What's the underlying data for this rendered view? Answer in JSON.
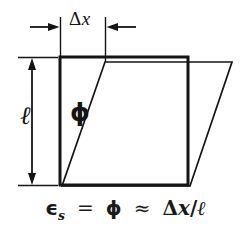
{
  "figure": {
    "background_color": "#ffffff",
    "ink_color": "#141414"
  },
  "labels": {
    "delta_x": "Δ",
    "delta_x_var": "x",
    "ell": "ℓ",
    "phi": "ϕ"
  },
  "equation": {
    "epsilon": "ϵ",
    "epsilon_subscript": "s",
    "equals": "=",
    "phi": "ϕ",
    "approx": "≈",
    "delta": "Δ",
    "x": "x",
    "slash": "/",
    "ell": "ℓ",
    "full_text": "ϵs = ϕ ≈ Δx/ℓ"
  },
  "dimensions": {
    "horizontal": {
      "name": "delta-x-dimension",
      "label": "Δx",
      "arrow_style": "inward-pair",
      "extension_line_left_x": 60,
      "extension_line_right_x": 105,
      "arrow_y": 27
    },
    "vertical": {
      "name": "ell-dimension",
      "label": "ℓ",
      "arrow_style": "double-headed",
      "arrow_x": 32,
      "top_y": 57,
      "bottom_y": 185
    }
  },
  "shapes": {
    "undeformed_square": {
      "name": "undeformed-element",
      "stroke": "#141414",
      "stroke_width": 3,
      "fill": "none",
      "points": "60,57 188,57 188,185 60,185"
    },
    "deformed_parallelogram": {
      "name": "deformed-element",
      "stroke": "#141414",
      "stroke_width": 1.6,
      "fill": "none",
      "points": "105,62 232,62 190,186 62,186"
    }
  },
  "annotations": {
    "phi_angle": {
      "name": "shear-angle-phi",
      "description": "angle between undeformed left edge and deformed left edge"
    }
  }
}
